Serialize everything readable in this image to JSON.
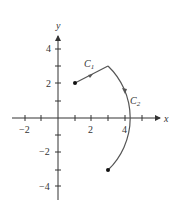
{
  "diagram": {
    "axes": {
      "x_label": "x",
      "y_label": "y",
      "x_ticks": [
        -2,
        -1,
        1,
        2,
        3,
        4,
        5
      ],
      "x_tick_labels": [
        {
          "value": -2,
          "label": "−2"
        },
        {
          "value": 2,
          "label": "2"
        },
        {
          "value": 4,
          "label": "4"
        }
      ],
      "y_ticks": [
        -4,
        -3,
        -2,
        -1,
        1,
        2,
        3,
        4
      ],
      "y_tick_labels": [
        {
          "value": 4,
          "label": "4"
        },
        {
          "value": 2,
          "label": "2"
        },
        {
          "value": -2,
          "label": "−2"
        },
        {
          "value": -4,
          "label": "−4"
        }
      ]
    },
    "curves": [
      {
        "name": "C1",
        "label_main": "C",
        "label_sub": "1",
        "type": "line segment",
        "start": [
          1,
          2
        ],
        "end": [
          3,
          3
        ]
      },
      {
        "name": "C2",
        "label_main": "C",
        "label_sub": "2",
        "type": "circular arc",
        "start": [
          3,
          3
        ],
        "end": [
          3,
          -3
        ],
        "radius": 4.24
      }
    ],
    "points": [
      [
        1,
        2
      ],
      [
        3,
        -3
      ]
    ],
    "colors": {
      "axis": "#333333",
      "curve": "#555555",
      "point": "#111111"
    }
  }
}
